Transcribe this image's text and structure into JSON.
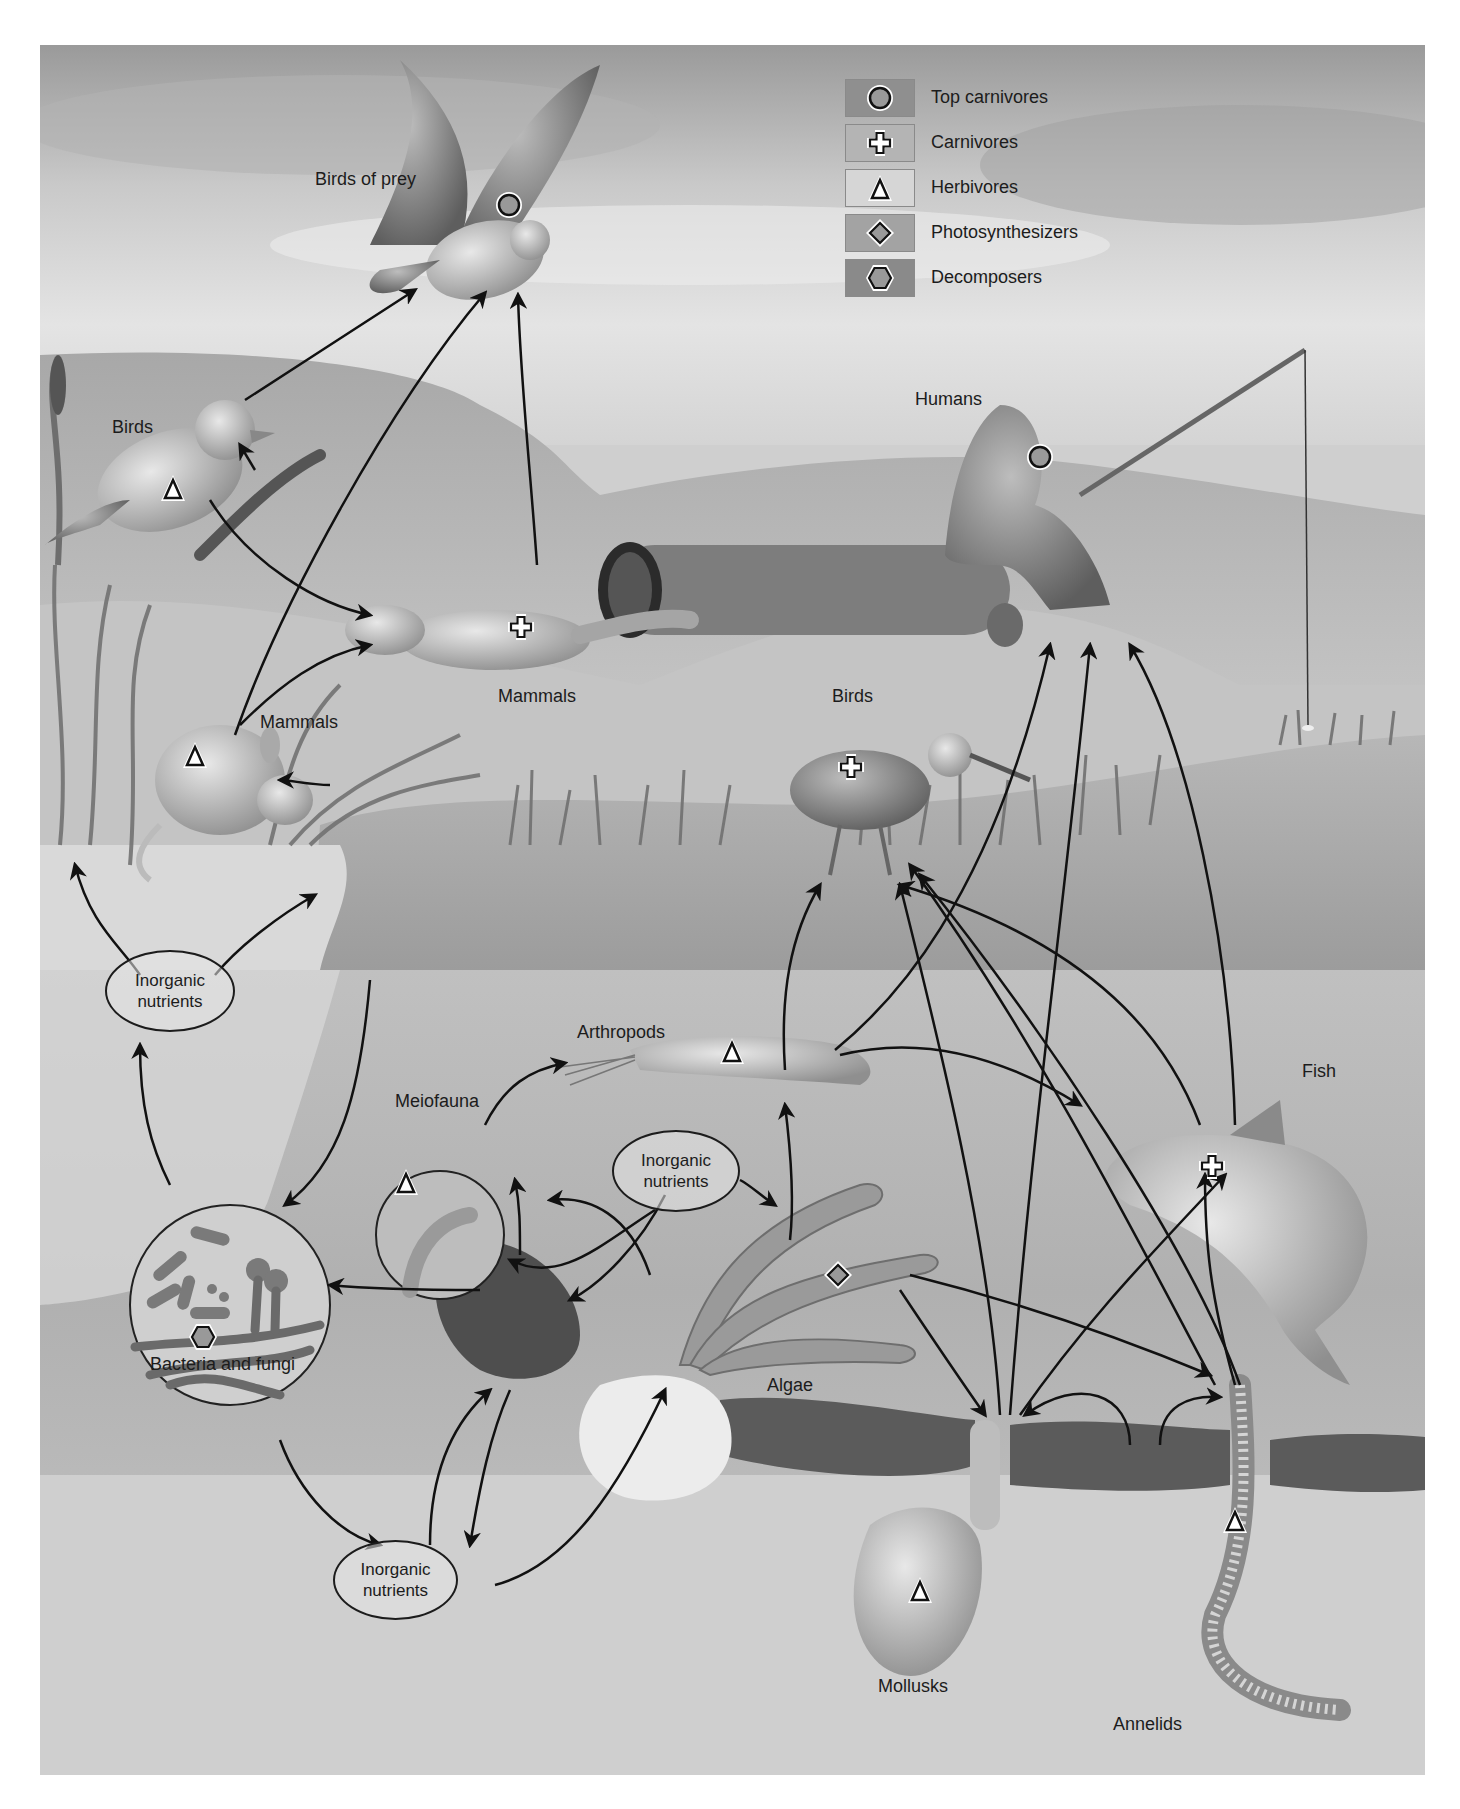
{
  "figure": {
    "colors": {
      "sky_dark": "#8e8e8e",
      "sky_light": "#e6e6e6",
      "land": "#b5b5b5",
      "water_surface": "#a9a9a9",
      "water_column": "#cdcdcd",
      "sediment": "#5a5a5a",
      "arrow": "#111111"
    }
  },
  "legend": {
    "items": [
      {
        "symbol": "circle-icon",
        "label": "Top carnivores",
        "swatch": "#8f8f8f"
      },
      {
        "symbol": "cross-icon",
        "label": "Carnivores",
        "swatch": "#b4b4b4"
      },
      {
        "symbol": "triangle-icon",
        "label": "Herbivores",
        "swatch": "#d6d6d6"
      },
      {
        "symbol": "diamond-icon",
        "label": "Photosynthesizers",
        "swatch": "#a3a3a3"
      },
      {
        "symbol": "hexagon-icon",
        "label": "Decomposers",
        "swatch": "#8a8a8a"
      }
    ]
  },
  "organisms": {
    "birds_of_prey": {
      "label": "Birds of prey",
      "role": "Top carnivores"
    },
    "humans": {
      "label": "Humans",
      "role": "Top carnivores"
    },
    "birds_songbird": {
      "label": "Birds",
      "role": "Herbivores"
    },
    "mammals_weasel": {
      "label": "Mammals",
      "role": "Carnivores"
    },
    "mammals_mouse": {
      "label": "Mammals",
      "role": "Herbivores"
    },
    "birds_wader": {
      "label": "Birds",
      "role": "Carnivores"
    },
    "arthropods": {
      "label": "Arthropods",
      "role": "Herbivores"
    },
    "fish": {
      "label": "Fish",
      "role": "Carnivores"
    },
    "meiofauna": {
      "label": "Meiofauna",
      "role": "Herbivores"
    },
    "algae": {
      "label": "Algae",
      "role": "Photosynthesizers"
    },
    "bacteria_fungi": {
      "label": "Bacteria and fungi",
      "role": "Decomposers"
    },
    "mollusks": {
      "label": "Mollusks",
      "role": "Herbivores"
    },
    "annelids": {
      "label": "Annelids",
      "role": "Herbivores"
    }
  },
  "nutrient_pools": [
    {
      "line1": "Inorganic",
      "line2": "nutrients"
    },
    {
      "line1": "Inorganic",
      "line2": "nutrients"
    },
    {
      "line1": "Inorganic",
      "line2": "nutrients"
    }
  ]
}
